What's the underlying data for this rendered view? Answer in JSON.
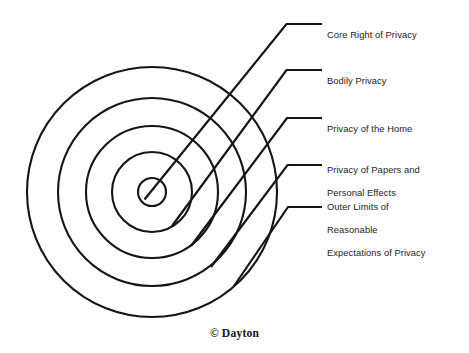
{
  "diagram": {
    "shape": "concentric-circles",
    "stroke_color": "#151515",
    "background_color": "#ffffff",
    "center": {
      "x": 152,
      "y": 192
    },
    "rings": [
      {
        "id": "ring-1",
        "label_ref": 0,
        "radius": 14
      },
      {
        "id": "ring-2",
        "label_ref": 1,
        "radius": 40
      },
      {
        "id": "ring-3",
        "label_ref": 2,
        "radius": 66
      },
      {
        "id": "ring-4",
        "label_ref": 3,
        "radius": 94
      },
      {
        "id": "ring-5",
        "label_ref": 4,
        "radius": 125
      }
    ],
    "labels": [
      {
        "id": "label-core-right-of-privacy",
        "text": "Core Right of Privacy",
        "lines": [
          "Core Right of Privacy"
        ],
        "elbow_y": 24,
        "text_top": 17
      },
      {
        "id": "label-bodily-privacy",
        "text": "Bodily Privacy",
        "lines": [
          "Bodily Privacy"
        ],
        "elbow_y": 70,
        "text_top": 63
      },
      {
        "id": "label-privacy-of-the-home",
        "text": "Privacy of the Home",
        "lines": [
          "Privacy of the Home"
        ],
        "elbow_y": 118,
        "text_top": 111
      },
      {
        "id": "label-privacy-of-papers-and-personal-effects",
        "text": "Privacy of Papers and Personal Effects",
        "lines": [
          "Privacy of Papers and",
          "Personal Effects"
        ],
        "elbow_y": 165,
        "text_top": 152
      },
      {
        "id": "label-outer-limits-of-reasonable-expectations-of-privacy",
        "text": "Outer Limits of Reasonable Expectations of Privacy",
        "lines": [
          "Outer Limits of",
          "Reasonable",
          "Expectations of Privacy"
        ],
        "elbow_y": 207,
        "text_top": 189
      }
    ]
  },
  "credit": {
    "text": "© Dayton",
    "symbol": "©",
    "name": "Dayton"
  }
}
